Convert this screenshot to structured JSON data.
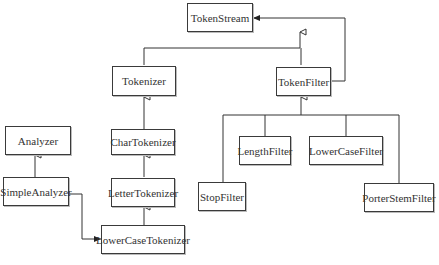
{
  "diagram": {
    "type": "uml-class-diagram",
    "nodes": {
      "token_stream": "TokenStream",
      "tokenizer": "Tokenizer",
      "token_filter": "TokenFilter",
      "char_tokenizer": "CharTokenizer",
      "letter_tokenizer": "LetterTokenizer",
      "lower_case_tokenizer": "LowerCaseTokenizer",
      "analyzer": "Analyzer",
      "simple_analyzer": "SimpleAnalyzer",
      "length_filter": "LengthFilter",
      "lower_case_filter": "LowerCaseFilter",
      "stop_filter": "StopFilter",
      "porter_stem_filter": "PorterStemFilter"
    },
    "edges": [
      {
        "from": "Tokenizer",
        "to": "TokenStream",
        "type": "inheritance"
      },
      {
        "from": "TokenFilter",
        "to": "TokenStream",
        "type": "inheritance"
      },
      {
        "from": "TokenFilter",
        "to": "TokenStream",
        "type": "association"
      },
      {
        "from": "CharTokenizer",
        "to": "Tokenizer",
        "type": "inheritance"
      },
      {
        "from": "LetterTokenizer",
        "to": "CharTokenizer",
        "type": "inheritance"
      },
      {
        "from": "LowerCaseTokenizer",
        "to": "LetterTokenizer",
        "type": "inheritance"
      },
      {
        "from": "SimpleAnalyzer",
        "to": "Analyzer",
        "type": "inheritance"
      },
      {
        "from": "SimpleAnalyzer",
        "to": "LowerCaseTokenizer",
        "type": "association"
      },
      {
        "from": "StopFilter",
        "to": "TokenFilter",
        "type": "inheritance"
      },
      {
        "from": "LengthFilter",
        "to": "TokenFilter",
        "type": "inheritance"
      },
      {
        "from": "LowerCaseFilter",
        "to": "TokenFilter",
        "type": "inheritance"
      },
      {
        "from": "PorterStemFilter",
        "to": "TokenFilter",
        "type": "inheritance"
      }
    ]
  }
}
